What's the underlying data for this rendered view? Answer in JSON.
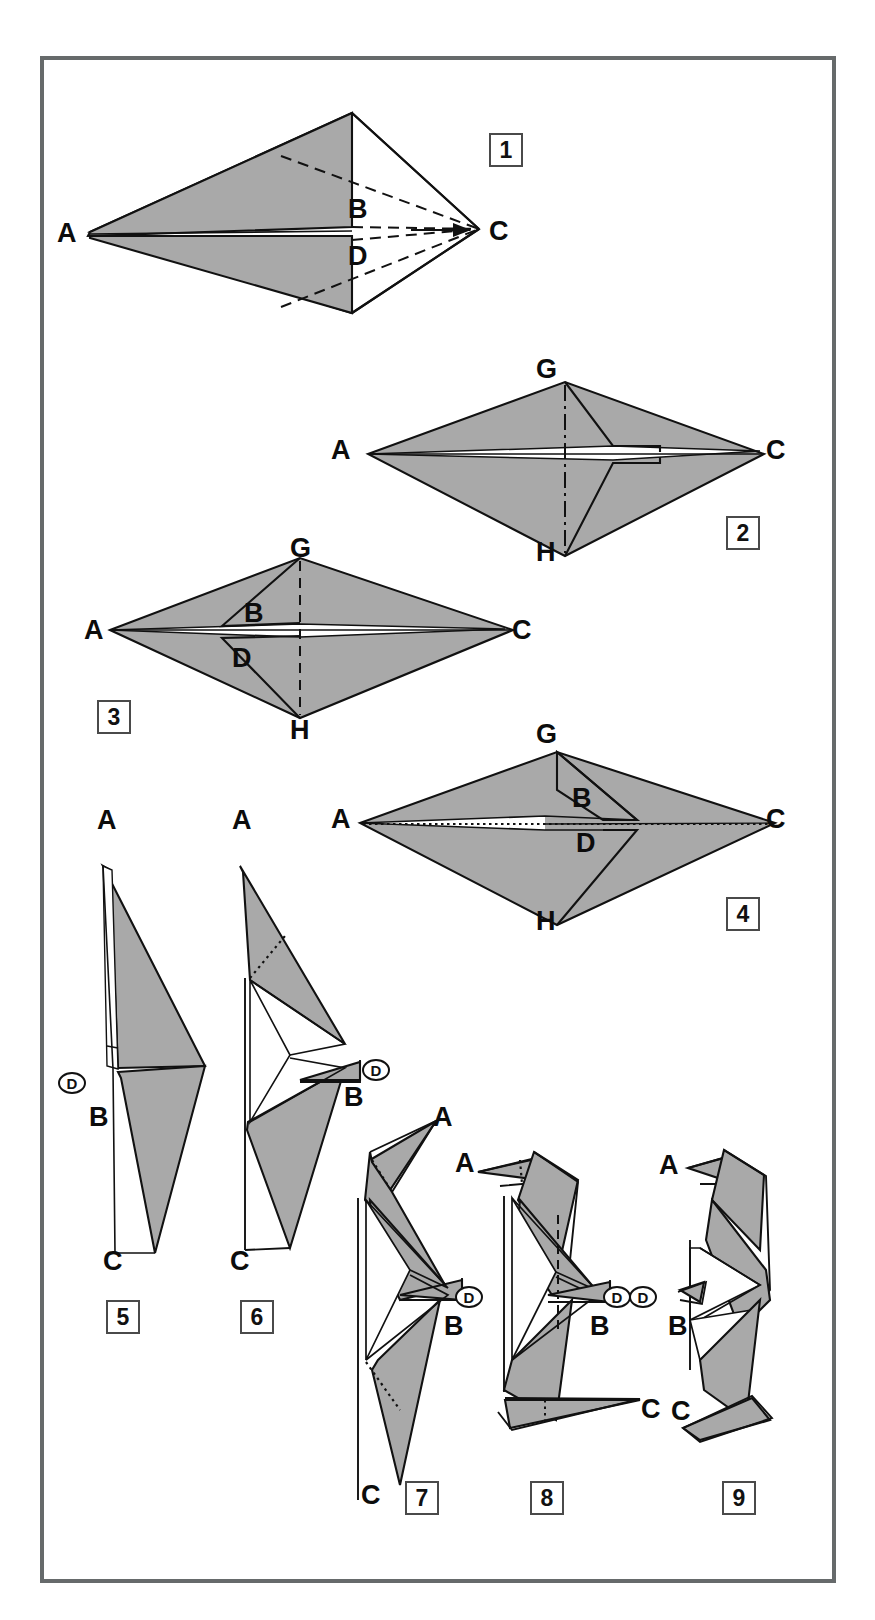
{
  "figure": {
    "type": "instruction-diagram",
    "total_steps": 9,
    "colors": {
      "paper_front": "#a9a9a9",
      "paper_back": "#ffffff",
      "outline": "#111111",
      "frame_border": "#666a6b",
      "background": "#ffffff"
    },
    "line_styles": [
      "solid",
      "dashed",
      "dash-dot",
      "dotted"
    ]
  },
  "steps": [
    {
      "number": "1",
      "box": {
        "x": 489,
        "y": 133
      },
      "labels": [
        {
          "text": "A",
          "x": 57,
          "y": 220
        },
        {
          "text": "B",
          "x": 348,
          "y": 196
        },
        {
          "text": "C",
          "x": 489,
          "y": 218
        },
        {
          "text": "D",
          "x": 348,
          "y": 243
        }
      ]
    },
    {
      "number": "2",
      "box": {
        "x": 726,
        "y": 516
      },
      "labels": [
        {
          "text": "G",
          "x": 536,
          "y": 356
        },
        {
          "text": "A",
          "x": 331,
          "y": 437
        },
        {
          "text": "C",
          "x": 766,
          "y": 437
        },
        {
          "text": "H",
          "x": 536,
          "y": 539
        }
      ]
    },
    {
      "number": "3",
      "box": {
        "x": 97,
        "y": 700
      },
      "labels": [
        {
          "text": "G",
          "x": 290,
          "y": 535
        },
        {
          "text": "A",
          "x": 84,
          "y": 617
        },
        {
          "text": "B",
          "x": 244,
          "y": 600
        },
        {
          "text": "D",
          "x": 232,
          "y": 645
        },
        {
          "text": "C",
          "x": 512,
          "y": 617
        },
        {
          "text": "H",
          "x": 290,
          "y": 717
        }
      ]
    },
    {
      "number": "4",
      "box": {
        "x": 726,
        "y": 897
      },
      "labels": [
        {
          "text": "G",
          "x": 536,
          "y": 721
        },
        {
          "text": "A",
          "x": 331,
          "y": 806
        },
        {
          "text": "B",
          "x": 572,
          "y": 785
        },
        {
          "text": "C",
          "x": 766,
          "y": 806
        },
        {
          "text": "D",
          "x": 576,
          "y": 830
        },
        {
          "text": "H",
          "x": 536,
          "y": 908
        }
      ]
    },
    {
      "number": "5",
      "box": {
        "x": 106,
        "y": 1300
      },
      "labels": [
        {
          "text": "A",
          "x": 97,
          "y": 807
        },
        {
          "text": "B",
          "x": 89,
          "y": 1104
        },
        {
          "text": "C",
          "x": 103,
          "y": 1248
        }
      ],
      "circled": [
        {
          "text": "D",
          "x": 58,
          "y": 1072
        }
      ]
    },
    {
      "number": "6",
      "box": {
        "x": 240,
        "y": 1300
      },
      "labels": [
        {
          "text": "A",
          "x": 232,
          "y": 807
        },
        {
          "text": "B",
          "x": 344,
          "y": 1084
        },
        {
          "text": "C",
          "x": 230,
          "y": 1248
        }
      ],
      "circled": [
        {
          "text": "D",
          "x": 362,
          "y": 1059
        }
      ]
    },
    {
      "number": "7",
      "box": {
        "x": 405,
        "y": 1481
      },
      "labels": [
        {
          "text": "A",
          "x": 433,
          "y": 1104
        },
        {
          "text": "B",
          "x": 444,
          "y": 1313
        },
        {
          "text": "C",
          "x": 361,
          "y": 1482
        }
      ],
      "circled": [
        {
          "text": "D",
          "x": 455,
          "y": 1286
        }
      ]
    },
    {
      "number": "8",
      "box": {
        "x": 530,
        "y": 1481
      },
      "labels": [
        {
          "text": "A",
          "x": 455,
          "y": 1150
        },
        {
          "text": "B",
          "x": 590,
          "y": 1313
        },
        {
          "text": "C",
          "x": 641,
          "y": 1396
        }
      ],
      "circled": [
        {
          "text": "D",
          "x": 603,
          "y": 1286
        }
      ]
    },
    {
      "number": "9",
      "box": {
        "x": 722,
        "y": 1481
      },
      "labels": [
        {
          "text": "A",
          "x": 659,
          "y": 1152
        },
        {
          "text": "B",
          "x": 668,
          "y": 1313
        },
        {
          "text": "C",
          "x": 671,
          "y": 1398
        }
      ],
      "circled": [
        {
          "text": "D",
          "x": 629,
          "y": 1286
        }
      ]
    }
  ]
}
